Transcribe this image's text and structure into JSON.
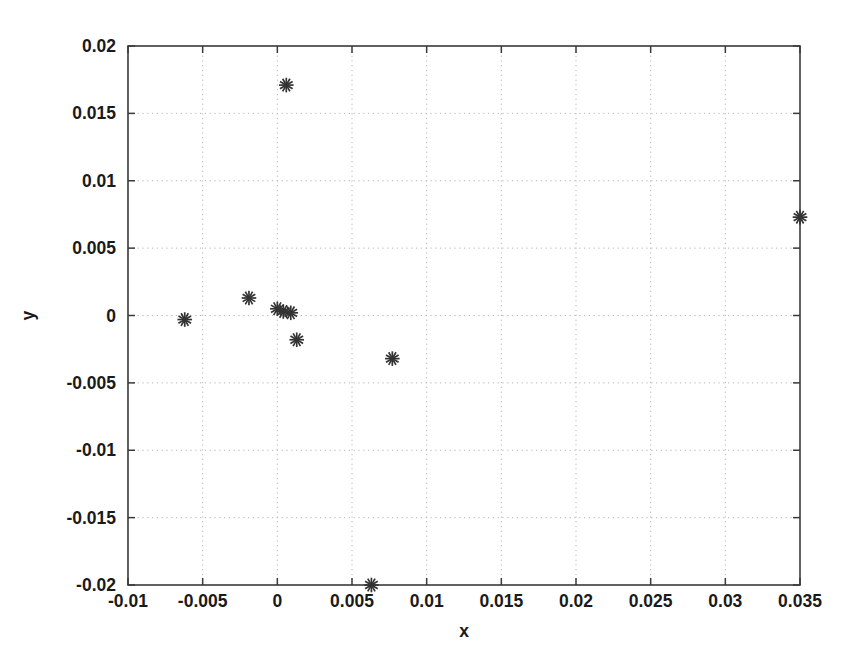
{
  "chart_data": {
    "type": "scatter",
    "title": "",
    "xlabel": "x",
    "ylabel": "y",
    "xlim": [
      -0.01,
      0.035
    ],
    "ylim": [
      -0.02,
      0.02
    ],
    "grid": true,
    "legend": null,
    "marker": "asterisk",
    "marker_color": "#333333",
    "xticks": [
      "-0.01",
      "-0.005",
      "0",
      "0.005",
      "0.01",
      "0.015",
      "0.02",
      "0.025",
      "0.03",
      "0.035"
    ],
    "xtick_values": [
      -0.01,
      -0.005,
      0,
      0.005,
      0.01,
      0.015,
      0.02,
      0.025,
      0.03,
      0.035
    ],
    "yticks": [
      "0.02",
      "0.015",
      "0.01",
      "0.005",
      "0",
      "-0.005",
      "-0.01",
      "-0.015",
      "-0.02"
    ],
    "ytick_values": [
      0.02,
      0.015,
      0.01,
      0.005,
      0,
      -0.005,
      -0.01,
      -0.015,
      -0.02
    ],
    "points": [
      {
        "x": 0.0006,
        "y": 0.0171
      },
      {
        "x": 0.035,
        "y": 0.0073
      },
      {
        "x": -0.0019,
        "y": 0.0013
      },
      {
        "x": 0.0,
        "y": 0.0005
      },
      {
        "x": 0.0004,
        "y": 0.0003
      },
      {
        "x": 0.0009,
        "y": 0.0002
      },
      {
        "x": -0.0062,
        "y": -0.0003
      },
      {
        "x": 0.0013,
        "y": -0.0018
      },
      {
        "x": 0.0077,
        "y": -0.0032
      },
      {
        "x": 0.0063,
        "y": -0.02
      }
    ]
  },
  "scan_artifacts": {
    "bottom_left": "",
    "bottom_right": ""
  }
}
